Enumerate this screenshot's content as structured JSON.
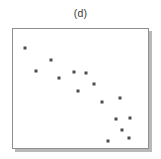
{
  "figure": {
    "panel_label": "(d)",
    "background_color": "#ffffff",
    "frame_color": "#8e8e8e",
    "shadow_color": "#b9b9b9",
    "point_color": "#4d4d4d"
  },
  "chart_data": {
    "type": "scatter",
    "title": "(d)",
    "xlabel": "",
    "ylabel": "",
    "xlim": [
      0,
      100
    ],
    "ylim": [
      0,
      100
    ],
    "grid": false,
    "legend": null,
    "tick_labels": {
      "x": [],
      "y": []
    },
    "annotations": [],
    "series": [
      {
        "name": "points",
        "marker": "square",
        "color": "#4d4d4d",
        "points": [
          {
            "x": 9,
            "y": 84
          },
          {
            "x": 28,
            "y": 74
          },
          {
            "x": 17,
            "y": 65
          },
          {
            "x": 34,
            "y": 59
          },
          {
            "x": 45,
            "y": 64
          },
          {
            "x": 54,
            "y": 63
          },
          {
            "x": 60,
            "y": 54
          },
          {
            "x": 48,
            "y": 48
          },
          {
            "x": 66,
            "y": 39
          },
          {
            "x": 79,
            "y": 42
          },
          {
            "x": 76,
            "y": 24
          },
          {
            "x": 87,
            "y": 25
          },
          {
            "x": 81,
            "y": 15
          },
          {
            "x": 70,
            "y": 6
          },
          {
            "x": 86,
            "y": 8
          }
        ]
      }
    ]
  }
}
